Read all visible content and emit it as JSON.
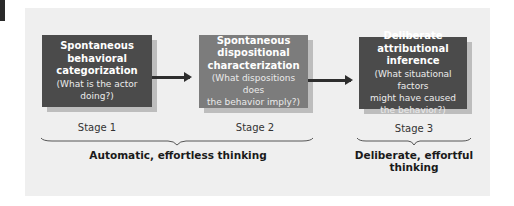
{
  "diagram": {
    "stages": [
      {
        "title": "Spontaneous behavioral categorization",
        "title_lines": [
          "Spontaneous",
          "behavioral",
          "categorization"
        ],
        "question_lines": [
          "(What is the actor doing?)"
        ],
        "label": "Stage 1",
        "color": "#4b4b4b"
      },
      {
        "title": "Spontaneous dispositional characterization",
        "title_lines": [
          "Spontaneous",
          "dispositional",
          "characterization"
        ],
        "question_lines": [
          "(What dispositions does",
          "the behavior imply?)"
        ],
        "label": "Stage 2",
        "color": "#7c7c7c"
      },
      {
        "title": "Deliberate attributional inference",
        "title_lines": [
          "Deliberate",
          "attributional inference"
        ],
        "question_lines": [
          "(What situational factors",
          "might have caused",
          "the behavior?)"
        ],
        "label": "Stage 3",
        "color": "#4b4b4b"
      }
    ],
    "groups": [
      {
        "label": "Automatic, effortless thinking",
        "spans": [
          "Stage 1",
          "Stage 2"
        ]
      },
      {
        "label_lines": [
          "Deliberate, effortful",
          "thinking"
        ],
        "label": "Deliberate, effortful thinking",
        "spans": [
          "Stage 3"
        ]
      }
    ],
    "arrows": [
      {
        "from": "Stage 1",
        "to": "Stage 2"
      },
      {
        "from": "Stage 2",
        "to": "Stage 3"
      }
    ],
    "colors": {
      "panel_background": "#efefef",
      "box_dark": "#4b4b4b",
      "box_medium": "#7c7c7c",
      "box_shadow": "#bdbdbd",
      "arrow": "#2e2e2e"
    }
  }
}
